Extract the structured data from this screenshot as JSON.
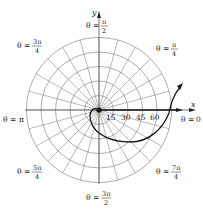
{
  "figure": {
    "type": "polar-grid-diagram",
    "center": {
      "x": 99,
      "y": 110
    },
    "grid": {
      "ring_radii_px": [
        14.5,
        29,
        43.5,
        58,
        72.5
      ],
      "spoke_count": 24,
      "spoke_step_degrees": 15,
      "line_color": "#8a8a8a",
      "curve_color": "#1a1a1a"
    },
    "axes": {
      "x_label": "x",
      "y_label": "y"
    },
    "radial_ticks": [
      "15",
      "30",
      "45",
      "60"
    ],
    "angle_labels": [
      {
        "id": "zero",
        "prefix": "θ = ",
        "value": "0"
      },
      {
        "id": "pi4",
        "prefix": "θ = ",
        "num": "π",
        "den": "4"
      },
      {
        "id": "pi2",
        "prefix": "θ = ",
        "num": "π",
        "den": "2"
      },
      {
        "id": "3pi4",
        "prefix": "θ = ",
        "num": "3π",
        "den": "4"
      },
      {
        "id": "pi",
        "prefix": "θ = ",
        "value": "π"
      },
      {
        "id": "5pi4",
        "prefix": "θ = ",
        "num": "5π",
        "den": "4"
      },
      {
        "id": "3pi2",
        "prefix": "θ = ",
        "num": "3π",
        "den": "2"
      },
      {
        "id": "7pi4",
        "prefix": "θ = ",
        "num": "7π",
        "den": "4"
      }
    ]
  }
}
